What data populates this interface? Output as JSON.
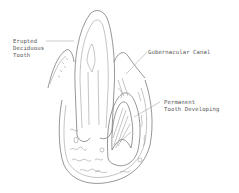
{
  "diagram": {
    "labels": {
      "erupted_1": "Erupted",
      "erupted_2": "Deciduous",
      "erupted_3": "Tooth",
      "canal": "Gubernacular Canal",
      "permanent_1": "Permanent",
      "permanent_2": "Tooth Developing"
    },
    "colors": {
      "line": "#6a6a6a",
      "text": "#555555",
      "background": "#ffffff"
    }
  }
}
